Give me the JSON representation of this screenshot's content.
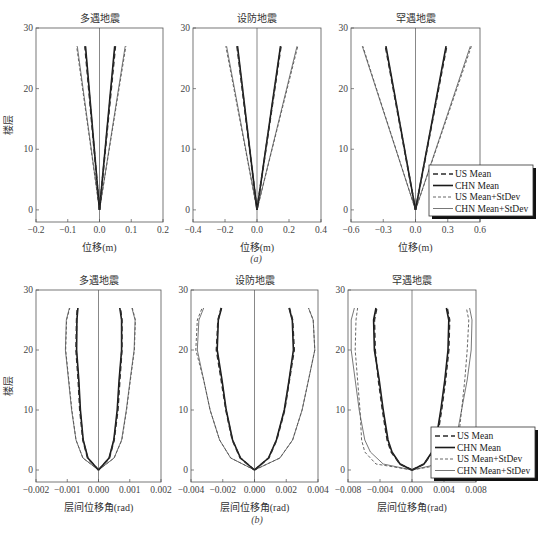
{
  "chart_data": [
    {
      "panel": "a",
      "subfig_label": "(a)",
      "type": "line",
      "title": "多遇地震",
      "xlabel": "位移(m)",
      "ylabel": "楼层",
      "xlim": [
        -0.2,
        0.2
      ],
      "ylim": [
        -2,
        30
      ],
      "xticks": [
        "-0.2",
        "-0.1",
        "0.0",
        "0.1",
        "0.2"
      ],
      "yticks": [
        "0",
        "10",
        "20",
        "30"
      ],
      "grid": false,
      "floors": [
        0,
        27
      ],
      "series": [
        {
          "name": "US Mean",
          "left": [
            0,
            -0.046
          ],
          "right": [
            0,
            0.05
          ]
        },
        {
          "name": "CHN Mean",
          "left": [
            0,
            -0.044
          ],
          "right": [
            0,
            0.048
          ]
        },
        {
          "name": "US Mean+StDev",
          "left": [
            0,
            -0.072
          ],
          "right": [
            0,
            0.083
          ]
        },
        {
          "name": "CHN Mean+StDev",
          "left": [
            0,
            -0.07
          ],
          "right": [
            0,
            0.081
          ]
        }
      ]
    },
    {
      "panel": "a",
      "type": "line",
      "title": "设防地震",
      "xlabel": "位移(m)",
      "ylabel": "",
      "xlim": [
        -0.4,
        0.4
      ],
      "ylim": [
        -2,
        30
      ],
      "xticks": [
        "-0.4",
        "-0.2",
        "0.0",
        "0.2",
        "0.4"
      ],
      "yticks": [
        "0",
        "10",
        "20",
        "30"
      ],
      "grid": false,
      "floors": [
        0,
        27
      ],
      "series": [
        {
          "name": "US Mean",
          "left": [
            0,
            -0.125
          ],
          "right": [
            0,
            0.15
          ]
        },
        {
          "name": "CHN Mean",
          "left": [
            0,
            -0.122
          ],
          "right": [
            0,
            0.147
          ]
        },
        {
          "name": "US Mean+StDev",
          "left": [
            0,
            -0.195
          ],
          "right": [
            0,
            0.255
          ]
        },
        {
          "name": "CHN Mean+StDev",
          "left": [
            0,
            -0.19
          ],
          "right": [
            0,
            0.25
          ]
        }
      ]
    },
    {
      "panel": "a",
      "type": "line",
      "title": "罕遇地震",
      "xlabel": "位移(m)",
      "ylabel": "",
      "xlim": [
        -0.6,
        0.6
      ],
      "ylim": [
        -2,
        30
      ],
      "xticks": [
        "-0.6",
        "-0.3",
        "0.0",
        "0.3",
        "0.6"
      ],
      "yticks": [
        "0",
        "10",
        "20",
        "30"
      ],
      "grid": false,
      "floors": [
        0,
        27
      ],
      "legend_position": "lower right",
      "series": [
        {
          "name": "US Mean",
          "left": [
            0,
            -0.28
          ],
          "right": [
            0,
            0.29
          ]
        },
        {
          "name": "CHN Mean",
          "left": [
            0,
            -0.275
          ],
          "right": [
            0,
            0.285
          ]
        },
        {
          "name": "US Mean+StDev",
          "left": [
            0,
            -0.49
          ],
          "right": [
            0,
            0.52
          ]
        },
        {
          "name": "CHN Mean+StDev",
          "left": [
            0,
            -0.495
          ],
          "right": [
            0,
            0.51
          ]
        }
      ]
    },
    {
      "panel": "b",
      "subfig_label": "(b)",
      "type": "line",
      "title": "多遇地震",
      "xlabel": "层间位移角(rad)",
      "ylabel": "楼层",
      "xlim": [
        -0.002,
        0.002
      ],
      "ylim": [
        -2,
        30
      ],
      "xticks": [
        "-0.002",
        "-0.001",
        "0.000",
        "0.001",
        "0.002"
      ],
      "yticks": [
        "0",
        "10",
        "20",
        "30"
      ],
      "grid": false,
      "floors": [
        0,
        2,
        5,
        10,
        15,
        20,
        25,
        27
      ],
      "series": [
        {
          "name": "US Mean",
          "left": [
            0,
            -0.00035,
            -0.0005,
            -0.0006,
            -0.00065,
            -0.00072,
            -0.0007,
            -0.00068
          ],
          "right": [
            0,
            0.00035,
            0.0005,
            0.00062,
            0.00068,
            0.00075,
            0.00075,
            0.0007
          ]
        },
        {
          "name": "CHN Mean",
          "left": [
            0,
            -0.00034,
            -0.00049,
            -0.00058,
            -0.00063,
            -0.0007,
            -0.00069,
            -0.00066
          ],
          "right": [
            0,
            0.00034,
            0.00049,
            0.0006,
            0.00066,
            0.00074,
            0.00074,
            0.00068
          ]
        },
        {
          "name": "US Mean+StDev",
          "left": [
            0,
            -0.0005,
            -0.00072,
            -0.00085,
            -0.00095,
            -0.00105,
            -0.00102,
            -0.00092
          ],
          "right": [
            0,
            0.0005,
            0.00075,
            0.0009,
            0.00102,
            0.00115,
            0.00118,
            0.00108
          ]
        },
        {
          "name": "CHN Mean+StDev",
          "left": [
            0,
            -0.0005,
            -0.00072,
            -0.00086,
            -0.00096,
            -0.00106,
            -0.00103,
            -0.00093
          ],
          "right": [
            0,
            0.0005,
            0.00074,
            0.00089,
            0.00101,
            0.00114,
            0.00117,
            0.00107
          ]
        }
      ]
    },
    {
      "panel": "b",
      "type": "line",
      "title": "设防地震",
      "xlabel": "层间位移角(rad)",
      "ylabel": "",
      "xlim": [
        -0.004,
        0.004
      ],
      "ylim": [
        -2,
        30
      ],
      "xticks": [
        "-0.004",
        "-0.002",
        "0.000",
        "0.002",
        "0.004"
      ],
      "yticks": [
        "0",
        "10",
        "20",
        "30"
      ],
      "grid": false,
      "floors": [
        0,
        2,
        5,
        10,
        15,
        20,
        25,
        27
      ],
      "series": [
        {
          "name": "US Mean",
          "left": [
            0,
            -0.0009,
            -0.0014,
            -0.0018,
            -0.0021,
            -0.0024,
            -0.0023,
            -0.0021
          ],
          "right": [
            0,
            0.0009,
            0.0014,
            0.0019,
            0.0022,
            0.0025,
            0.0024,
            0.0022
          ]
        },
        {
          "name": "CHN Mean",
          "left": [
            0,
            -0.00088,
            -0.00138,
            -0.00178,
            -0.00205,
            -0.00235,
            -0.00228,
            -0.00208
          ],
          "right": [
            0,
            0.00088,
            0.00138,
            0.00188,
            0.00218,
            0.00245,
            0.00238,
            0.00218
          ]
        },
        {
          "name": "US Mean+StDev",
          "left": [
            0,
            -0.0015,
            -0.0022,
            -0.0028,
            -0.0032,
            -0.0037,
            -0.0036,
            -0.0033
          ],
          "right": [
            0,
            0.0016,
            0.0024,
            0.003,
            0.0034,
            0.0038,
            0.0037,
            0.0034
          ]
        },
        {
          "name": "CHN Mean+StDev",
          "left": [
            0,
            -0.0015,
            -0.0022,
            -0.0028,
            -0.0032,
            -0.0036,
            -0.0035,
            -0.0032
          ],
          "right": [
            0,
            0.0016,
            0.0024,
            0.003,
            0.0034,
            0.0038,
            0.0037,
            0.0034
          ]
        }
      ]
    },
    {
      "panel": "b",
      "type": "line",
      "title": "罕遇地震",
      "xlabel": "层间位移角(rad)",
      "ylabel": "",
      "xlim": [
        -0.008,
        0.008
      ],
      "ylim": [
        -2,
        30
      ],
      "xticks": [
        "-0.008",
        "-0.004",
        "0.000",
        "0.004",
        "0.008"
      ],
      "yticks": [
        "0",
        "10",
        "20",
        "30"
      ],
      "grid": false,
      "floors": [
        0,
        1,
        3,
        5,
        10,
        15,
        20,
        25,
        27
      ],
      "legend_position": "lower right",
      "series": [
        {
          "name": "US Mean",
          "left": [
            0,
            -0.0015,
            -0.0026,
            -0.0031,
            -0.0037,
            -0.0042,
            -0.0046,
            -0.0047,
            -0.0044
          ],
          "right": [
            0,
            0.0015,
            0.0026,
            0.0031,
            0.0037,
            0.0042,
            0.0046,
            0.0047,
            0.0044
          ]
        },
        {
          "name": "CHN Mean",
          "left": [
            0,
            -0.0015,
            -0.0025,
            -0.003,
            -0.0036,
            -0.0041,
            -0.0047,
            -0.0048,
            -0.0045
          ],
          "right": [
            0,
            0.0015,
            0.0025,
            0.003,
            0.0036,
            0.0041,
            0.0045,
            0.0046,
            0.0043
          ]
        },
        {
          "name": "US Mean+StDev",
          "left": [
            0,
            -0.0045,
            -0.0059,
            -0.0063,
            -0.0065,
            -0.0068,
            -0.0071,
            -0.007,
            -0.0068
          ],
          "right": [
            0,
            0.0042,
            0.0054,
            0.0058,
            0.0062,
            0.0066,
            0.0069,
            0.0071,
            0.0068
          ]
        },
        {
          "name": "CHN Mean+StDev",
          "left": [
            0,
            -0.0036,
            -0.0052,
            -0.0059,
            -0.0066,
            -0.0071,
            -0.0076,
            -0.0076,
            -0.0072
          ],
          "right": [
            0,
            0.0033,
            0.0048,
            0.0055,
            0.0062,
            0.0069,
            0.0074,
            0.0075,
            0.0072
          ]
        }
      ]
    }
  ],
  "legend": {
    "items": [
      "US Mean",
      "CHN Mean",
      "US Mean+StDev",
      "CHN Mean+StDev"
    ]
  },
  "styles": {
    "US Mean": {
      "color": "#2a2a2a",
      "width": 1.6,
      "dash": "5,3"
    },
    "CHN Mean": {
      "color": "#1a1a1a",
      "width": 1.6,
      "dash": ""
    },
    "US Mean+StDev": {
      "color": "#555555",
      "width": 0.9,
      "dash": "3,2"
    },
    "CHN Mean+StDev": {
      "color": "#555555",
      "width": 0.8,
      "dash": ""
    }
  },
  "subfigure_labels": {
    "a": "(a)",
    "b": "(b)"
  }
}
